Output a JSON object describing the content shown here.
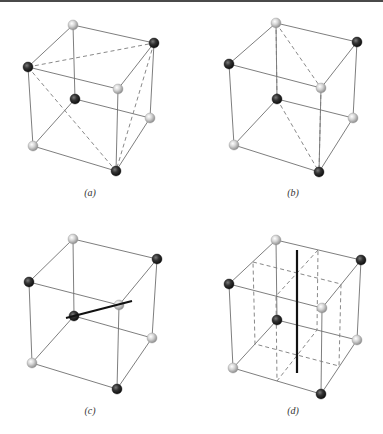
{
  "figure": {
    "colors": {
      "light_atom": "#c9c9c9",
      "dark_atom": "#2e2e2e",
      "edge": "#6f6f6f",
      "axis": "#111111",
      "top_bar": "#4a4a4a"
    },
    "panels": [
      {
        "id": "a",
        "label": "(a)",
        "label_pos": [
          90,
          196
        ],
        "vertices": {
          "TBL": {
            "x": 73,
            "y": 25,
            "atom": "light"
          },
          "TBR": {
            "x": 154,
            "y": 43,
            "atom": "dark"
          },
          "TFL": {
            "x": 28,
            "y": 67,
            "atom": "dark"
          },
          "TFR": {
            "x": 118,
            "y": 89,
            "atom": "light"
          },
          "BBL": {
            "x": 75,
            "y": 99,
            "atom": "dark"
          },
          "BBR": {
            "x": 150,
            "y": 118,
            "atom": "light"
          },
          "BFL": {
            "x": 33,
            "y": 146,
            "atom": "light"
          },
          "BFR": {
            "x": 116,
            "y": 171,
            "atom": "dark"
          }
        },
        "dashed_lines": [
          [
            "TFL",
            "TBR"
          ],
          [
            "TFL",
            "BFR"
          ],
          [
            "TBR",
            "BFR"
          ]
        ],
        "note": "Tetrahedron formed by dark atoms (dashed)"
      },
      {
        "id": "b",
        "label": "(b)",
        "label_pos": [
          293,
          196
        ],
        "vertices": {
          "TBL": {
            "x": 276,
            "y": 23,
            "atom": "light"
          },
          "TBR": {
            "x": 357,
            "y": 42,
            "atom": "dark"
          },
          "TFL": {
            "x": 229,
            "y": 64,
            "atom": "dark"
          },
          "TFR": {
            "x": 321,
            "y": 88,
            "atom": "light"
          },
          "BBL": {
            "x": 277,
            "y": 99,
            "atom": "dark"
          },
          "BBR": {
            "x": 353,
            "y": 118,
            "atom": "light"
          },
          "BFL": {
            "x": 234,
            "y": 145,
            "atom": "light"
          },
          "BFR": {
            "x": 319,
            "y": 172,
            "atom": "dark"
          }
        },
        "dashed_lines": [
          [
            "TBL",
            "BBL"
          ],
          [
            "TBL",
            "TFR"
          ],
          [
            "TFR",
            "BFR"
          ],
          [
            "BBL",
            "BFR"
          ]
        ],
        "note": "Diagonal mirror plane (dashed)"
      },
      {
        "id": "c",
        "label": "(c)",
        "label_pos": [
          90,
          414
        ],
        "vertices": {
          "TBL": {
            "x": 73,
            "y": 239,
            "atom": "light"
          },
          "TBR": {
            "x": 157,
            "y": 259,
            "atom": "dark"
          },
          "TFL": {
            "x": 29,
            "y": 282,
            "atom": "dark"
          },
          "TFR": {
            "x": 119,
            "y": 305,
            "atom": "light"
          },
          "BBL": {
            "x": 74,
            "y": 316,
            "atom": "dark"
          },
          "BBR": {
            "x": 152,
            "y": 338,
            "atom": "light"
          },
          "BFL": {
            "x": 32,
            "y": 363,
            "atom": "light"
          },
          "BFR": {
            "x": 117,
            "y": 389,
            "atom": "dark"
          }
        },
        "dashed_lines": [],
        "axis_line": {
          "x1": 66,
          "y1": 318,
          "x2": 132,
          "y2": 301
        },
        "note": "Rotation axis through body diagonal (thick line)"
      },
      {
        "id": "d",
        "label": "(d)",
        "label_pos": [
          293,
          414
        ],
        "vertices": {
          "TBL": {
            "x": 276,
            "y": 240,
            "atom": "light"
          },
          "TBR": {
            "x": 361,
            "y": 260,
            "atom": "dark"
          },
          "TFL": {
            "x": 229,
            "y": 284,
            "atom": "dark"
          },
          "TFR": {
            "x": 322,
            "y": 308,
            "atom": "light"
          },
          "BBL": {
            "x": 277,
            "y": 320,
            "atom": "dark"
          },
          "BBR": {
            "x": 357,
            "y": 340,
            "atom": "light"
          },
          "BFL": {
            "x": 233,
            "y": 368,
            "atom": "light"
          },
          "BFR": {
            "x": 321,
            "y": 394,
            "atom": "dark"
          }
        },
        "dashed_planes": [
          [
            [
              253,
              262
            ],
            [
              341,
              284
            ],
            [
              339,
              366
            ],
            [
              255,
              344
            ]
          ],
          [
            [
              318,
              250
            ],
            [
              276,
              296
            ],
            [
              277,
              381
            ],
            [
              317,
              330
            ]
          ]
        ],
        "axis_line": {
          "x1": 297,
          "y1": 250,
          "x2": 297,
          "y2": 373
        },
        "note": "Two mid-planes (dashed) intersecting along a 4-bar axis (thick vertical line)"
      }
    ]
  }
}
